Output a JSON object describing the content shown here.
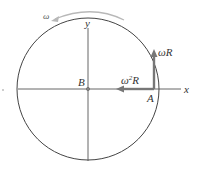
{
  "diagram": {
    "labels": {
      "omega": "ω",
      "y_axis": "y",
      "x_axis": "x",
      "center": "B",
      "point": "A",
      "velocity": "ωR",
      "acceleration_base": "ω",
      "acceleration_sup": "2",
      "acceleration_tail": "R"
    },
    "colors": {
      "circle": "#444444",
      "axes": "#555555",
      "vectors": "#777777",
      "rotation_arrow": "#b0b0b0",
      "text": "#333333"
    },
    "geometry": {
      "center": [
        88,
        89
      ],
      "radius": 71,
      "point_A": [
        155,
        89
      ]
    }
  }
}
